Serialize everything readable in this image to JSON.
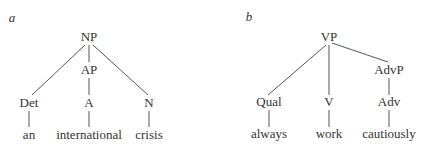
{
  "panels": [
    {
      "letter": "a",
      "root": "NP",
      "middle": "AP",
      "categories": [
        "Det",
        "A",
        "N"
      ],
      "words": [
        "an",
        "international",
        "crisis"
      ]
    },
    {
      "letter": "b",
      "root": "VP",
      "middle": "AdvP",
      "categories": [
        "Qual",
        "V",
        "Adv"
      ],
      "words": [
        "always",
        "work",
        "cautiously"
      ]
    }
  ]
}
